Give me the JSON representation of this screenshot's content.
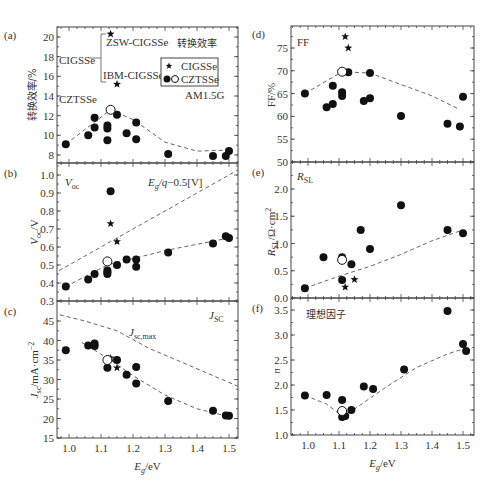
{
  "chart_data": [
    {
      "id": "a",
      "panel_label": "(a)",
      "type": "scatter",
      "title": "转换效率",
      "ylabel": "转换效率/%",
      "xlabel": "",
      "annotations": [
        "ZSW-CIGSSe",
        "IBM-CIGSSe",
        "CIGSSe",
        "CZTSSe",
        "AM1.5G"
      ],
      "legend": [
        {
          "marker": "star",
          "label": "CIGSSe"
        },
        {
          "marker": "filled-open-circle",
          "label": "CZTSSe"
        }
      ],
      "ylim": [
        7,
        21
      ],
      "yticks": [
        8,
        10,
        12,
        14,
        16,
        18,
        20
      ],
      "xlim": [
        0.95,
        1.55
      ],
      "series": [
        {
          "name": "CIGSSe",
          "marker": "star",
          "points": [
            [
              1.13,
              20.3
            ],
            [
              1.15,
              15.2
            ]
          ]
        },
        {
          "name": "CZTSSe",
          "marker": "filled",
          "points": [
            [
              0.99,
              9.1
            ],
            [
              1.06,
              10.0
            ],
            [
              1.08,
              11.8
            ],
            [
              1.08,
              10.8
            ],
            [
              1.12,
              11.0
            ],
            [
              1.12,
              10.7
            ],
            [
              1.12,
              9.5
            ],
            [
              1.15,
              12.1
            ],
            [
              1.18,
              10.2
            ],
            [
              1.21,
              11.3
            ],
            [
              1.21,
              9.6
            ],
            [
              1.31,
              8.1
            ],
            [
              1.45,
              7.9
            ],
            [
              1.49,
              7.9
            ],
            [
              1.5,
              8.4
            ]
          ]
        },
        {
          "name": "CZTSSe-record",
          "marker": "open",
          "points": [
            [
              1.13,
              12.6
            ]
          ]
        },
        {
          "name": "trend",
          "marker": "dashed",
          "points": [
            [
              0.99,
              9.1
            ],
            [
              1.13,
              12.6
            ],
            [
              1.2,
              11.6
            ],
            [
              1.3,
              9.3
            ],
            [
              1.4,
              8.4
            ],
            [
              1.5,
              8.5
            ]
          ]
        }
      ]
    },
    {
      "id": "b",
      "panel_label": "(b)",
      "type": "scatter",
      "ylabel": "Voc/V",
      "annotations": [
        "Voc",
        "Eg/q−0.5[V]"
      ],
      "ylim": [
        0.3,
        1.05
      ],
      "yticks": [
        0.3,
        0.4,
        0.5,
        0.6,
        0.7,
        0.8,
        0.9,
        1.0
      ],
      "series": [
        {
          "name": "CIGSSe",
          "marker": "star",
          "points": [
            [
              1.13,
              0.73
            ],
            [
              1.15,
              0.63
            ]
          ]
        },
        {
          "name": "CZTSSe",
          "marker": "filled",
          "points": [
            [
              0.99,
              0.38
            ],
            [
              1.06,
              0.42
            ],
            [
              1.08,
              0.45
            ],
            [
              1.12,
              0.47
            ],
            [
              1.12,
              0.46
            ],
            [
              1.12,
              0.45
            ],
            [
              1.13,
              0.91
            ],
            [
              1.15,
              0.5
            ],
            [
              1.18,
              0.53
            ],
            [
              1.21,
              0.53
            ],
            [
              1.21,
              0.49
            ],
            [
              1.31,
              0.57
            ],
            [
              1.45,
              0.62
            ],
            [
              1.49,
              0.66
            ],
            [
              1.5,
              0.65
            ]
          ]
        },
        {
          "name": "CZTSSe-record",
          "marker": "open",
          "points": [
            [
              1.12,
              0.52
            ]
          ]
        },
        {
          "name": "trend",
          "marker": "dashed",
          "points": [
            [
              0.99,
              0.38
            ],
            [
              1.12,
              0.5
            ],
            [
              1.3,
              0.58
            ],
            [
              1.5,
              0.65
            ]
          ]
        },
        {
          "name": "Eg/q-0.5",
          "marker": "dashed",
          "points": [
            [
              0.95,
              0.45
            ],
            [
              1.55,
              1.05
            ]
          ]
        }
      ]
    },
    {
      "id": "c",
      "panel_label": "(c)",
      "type": "scatter",
      "ylabel": "Jsc/mA·cm⁻²",
      "xlabel": "Eg/eV",
      "annotations": [
        "JSC",
        "Jsc,max"
      ],
      "ylim": [
        15,
        47
      ],
      "yticks": [
        15,
        20,
        25,
        30,
        35,
        40,
        45
      ],
      "xticks": [
        1.0,
        1.1,
        1.2,
        1.3,
        1.4,
        1.5
      ],
      "series": [
        {
          "name": "CIGSSe",
          "marker": "star",
          "points": [
            [
              1.13,
              35.5
            ],
            [
              1.15,
              33.0
            ]
          ]
        },
        {
          "name": "CZTSSe",
          "marker": "filled",
          "points": [
            [
              0.99,
              37.5
            ],
            [
              1.06,
              38.7
            ],
            [
              1.08,
              39.2
            ],
            [
              1.08,
              38.6
            ],
            [
              1.12,
              33.0
            ],
            [
              1.15,
              35.0
            ],
            [
              1.18,
              31.2
            ],
            [
              1.21,
              33.2
            ],
            [
              1.21,
              29.0
            ],
            [
              1.31,
              24.5
            ],
            [
              1.45,
              22.0
            ],
            [
              1.49,
              20.8
            ],
            [
              1.5,
              20.7
            ]
          ]
        },
        {
          "name": "CZTSSe-record",
          "marker": "open",
          "points": [
            [
              1.12,
              35.0
            ]
          ]
        },
        {
          "name": "trend",
          "marker": "dashed",
          "points": [
            [
              1.04,
              39.5
            ],
            [
              1.12,
              35.5
            ],
            [
              1.2,
              31.0
            ],
            [
              1.3,
              26.0
            ],
            [
              1.4,
              22.5
            ],
            [
              1.5,
              20.5
            ]
          ]
        },
        {
          "name": "Jsc,max",
          "marker": "dashed",
          "points": [
            [
              0.95,
              47.0
            ],
            [
              1.05,
              45.0
            ],
            [
              1.15,
              42.5
            ],
            [
              1.25,
              38.0
            ],
            [
              1.35,
              34.5
            ],
            [
              1.45,
              31.0
            ],
            [
              1.55,
              27.5
            ]
          ]
        }
      ]
    },
    {
      "id": "d",
      "panel_label": "(d)",
      "type": "scatter",
      "ylabel": "FF/%",
      "annotations": [
        "FF"
      ],
      "ylim": [
        50,
        79
      ],
      "yticks": [
        50,
        55,
        60,
        65,
        70,
        75
      ],
      "series": [
        {
          "name": "CIGSSe",
          "marker": "star",
          "points": [
            [
              1.12,
              77.5
            ],
            [
              1.13,
              75.0
            ]
          ]
        },
        {
          "name": "CZTSSe",
          "marker": "filled",
          "points": [
            [
              0.99,
              65.0
            ],
            [
              1.06,
              62.0
            ],
            [
              1.08,
              62.7
            ],
            [
              1.08,
              66.7
            ],
            [
              1.11,
              65.3
            ],
            [
              1.11,
              64.5
            ],
            [
              1.13,
              69.7
            ],
            [
              1.18,
              63.4
            ],
            [
              1.2,
              69.5
            ],
            [
              1.2,
              64.0
            ],
            [
              1.3,
              60.1
            ],
            [
              1.45,
              58.4
            ],
            [
              1.49,
              57.8
            ],
            [
              1.5,
              64.3
            ]
          ]
        },
        {
          "name": "CZTSSe-record",
          "marker": "open",
          "points": [
            [
              1.11,
              69.8
            ]
          ]
        },
        {
          "name": "trend",
          "marker": "dashed",
          "points": [
            [
              0.99,
              65.0
            ],
            [
              1.11,
              69.8
            ],
            [
              1.2,
              69.5
            ],
            [
              1.3,
              67.0
            ],
            [
              1.4,
              64.5
            ],
            [
              1.49,
              61.5
            ]
          ]
        }
      ]
    },
    {
      "id": "e",
      "panel_label": "(e)",
      "type": "scatter",
      "ylabel": "RSL/Ω·cm²",
      "annotations": [
        "RSL"
      ],
      "ylim": [
        0.0,
        2.5
      ],
      "yticks": [
        0.0,
        0.5,
        1.0,
        1.5,
        2.0
      ],
      "series": [
        {
          "name": "CIGSSe",
          "marker": "star",
          "points": [
            [
              1.12,
              0.2
            ],
            [
              1.15,
              0.34
            ]
          ]
        },
        {
          "name": "CZTSSe",
          "marker": "filled",
          "points": [
            [
              0.99,
              0.18
            ],
            [
              1.05,
              0.75
            ],
            [
              1.11,
              0.75
            ],
            [
              1.11,
              0.33
            ],
            [
              1.14,
              0.62
            ],
            [
              1.17,
              1.25
            ],
            [
              1.2,
              0.9
            ],
            [
              1.3,
              1.7
            ],
            [
              1.45,
              1.25
            ],
            [
              1.5,
              1.19
            ]
          ]
        },
        {
          "name": "CZTSSe-record",
          "marker": "open",
          "points": [
            [
              1.11,
              0.7
            ]
          ]
        },
        {
          "name": "trend",
          "marker": "dashed",
          "points": [
            [
              0.99,
              0.18
            ],
            [
              1.1,
              0.4
            ],
            [
              1.2,
              0.58
            ],
            [
              1.3,
              0.8
            ],
            [
              1.4,
              1.05
            ],
            [
              1.5,
              1.25
            ]
          ]
        }
      ]
    },
    {
      "id": "f",
      "panel_label": "(f)",
      "type": "scatter",
      "title": "理想因子",
      "ylabel": "n",
      "xlabel": "Eg/eV",
      "ylim": [
        1.0,
        3.6
      ],
      "yticks": [
        1.0,
        1.5,
        2.0,
        2.5,
        3.0,
        3.5
      ],
      "xticks": [
        1.0,
        1.1,
        1.2,
        1.3,
        1.4,
        1.5
      ],
      "series": [
        {
          "name": "CZTSSe",
          "marker": "filled",
          "points": [
            [
              0.99,
              1.79
            ],
            [
              1.06,
              1.8
            ],
            [
              1.11,
              1.7
            ],
            [
              1.11,
              1.36
            ],
            [
              1.12,
              1.38
            ],
            [
              1.14,
              1.5
            ],
            [
              1.18,
              1.97
            ],
            [
              1.21,
              1.92
            ],
            [
              1.31,
              2.31
            ],
            [
              1.45,
              3.48
            ],
            [
              1.5,
              2.82
            ],
            [
              1.51,
              2.68
            ]
          ]
        },
        {
          "name": "CZTSSe-record",
          "marker": "open",
          "points": [
            [
              1.11,
              1.48
            ]
          ]
        },
        {
          "name": "trend",
          "marker": "dashed",
          "points": [
            [
              0.99,
              1.79
            ],
            [
              1.06,
              1.62
            ],
            [
              1.11,
              1.38
            ],
            [
              1.15,
              1.52
            ],
            [
              1.25,
              1.95
            ],
            [
              1.35,
              2.35
            ],
            [
              1.45,
              2.62
            ],
            [
              1.5,
              2.72
            ]
          ]
        }
      ]
    }
  ],
  "panels_layout": {
    "left_x": [
      57,
      238
    ],
    "right_x": [
      291,
      474
    ],
    "a_y": [
      27,
      163
    ],
    "b_y": [
      163,
      301
    ],
    "c_y": [
      301,
      438
    ],
    "d_y": [
      26,
      162
    ],
    "e_y": [
      162,
      298
    ],
    "f_y": [
      298,
      435
    ]
  },
  "text": {
    "panel_a": "(a)",
    "panel_b": "(b)",
    "panel_c": "(c)",
    "panel_d": "(d)",
    "panel_e": "(e)",
    "panel_f": "(f)",
    "xlabel": "Eg/eV"
  }
}
